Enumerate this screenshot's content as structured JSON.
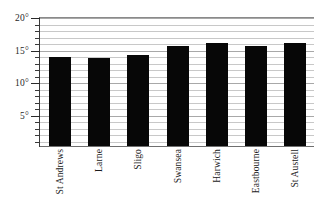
{
  "chart_data": {
    "type": "bar",
    "title": "",
    "xlabel": "",
    "ylabel": "",
    "categories": [
      "St Andrews",
      "Larne",
      "Sligo",
      "Swansea",
      "Harwich",
      "Eastbourne",
      "St Austell"
    ],
    "values": [
      13.8,
      13.7,
      14.2,
      15.6,
      16.0,
      15.5,
      16.0
    ],
    "ylim": [
      0,
      20
    ],
    "yticks": [
      5,
      10,
      15,
      20
    ],
    "ytick_labels": [
      "5°",
      "10°",
      "15°",
      "20°"
    ],
    "minor_tick_interval": 1,
    "grid": true,
    "grid_axis": "y",
    "legend": false,
    "bar_color": "#070707",
    "grid_color": "#c8c8c8",
    "axis_color": "#3a3a3a"
  }
}
